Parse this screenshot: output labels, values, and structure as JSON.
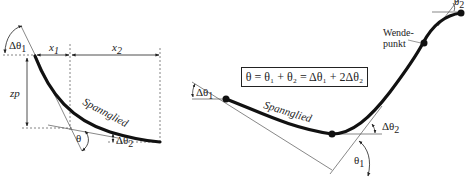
{
  "left_figure": {
    "labels": {
      "delta_theta_1": "Δθ",
      "delta_theta_1_sub": "1",
      "x1": "x",
      "x1_sub": "1",
      "x2": "x",
      "x2_sub": "2",
      "zp": "zp",
      "tendon": "Spannglied",
      "theta": "θ",
      "delta_theta_2": "Δθ",
      "delta_theta_2_sub": "2"
    }
  },
  "right_figure": {
    "formula": "θ = θ₁ + θ₂ = Δθ₁ + 2Δθ₂",
    "labels": {
      "delta_theta_1": "Δθ",
      "delta_theta_1_sub": "1",
      "tendon": "Spannglied",
      "delta_theta_2": "Δθ",
      "delta_theta_2_sub": "2",
      "theta_1": "θ",
      "theta_1_sub": "1",
      "theta_2": "θ",
      "theta_2_sub": "2",
      "inflection_point_line1": "Wende-",
      "inflection_point_line2": "punkt"
    }
  },
  "colors": {
    "ink": "#222222",
    "thin_line": "#555555",
    "background": "#ffffff"
  }
}
